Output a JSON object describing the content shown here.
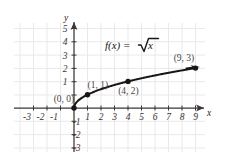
{
  "figure": {
    "axis_x_name": "x",
    "axis_y_name": "y",
    "function_label": "f(x) =",
    "function_radical": "x",
    "radical_symbol": "√",
    "point_labels": {
      "p0": "(0, 0)",
      "p1": "(1, 1)",
      "p4": "(4, 2)",
      "p9": "(9, 3)"
    },
    "x_ticks": [
      "-3",
      "-2",
      "-1",
      "1",
      "2",
      "3",
      "4",
      "5",
      "6",
      "7",
      "8",
      "9"
    ],
    "y_ticks": [
      "5",
      "4",
      "3",
      "2",
      "1",
      "-1",
      "-2",
      "-3"
    ],
    "colors": {
      "grid": "#e8e6e7",
      "axis": "#3b3638",
      "curve": "#1a1618",
      "text": "#231f20",
      "background": "#ffffff"
    }
  },
  "chart_data": {
    "type": "line",
    "xlabel": "x",
    "ylabel": "y",
    "xlim": [
      -4.5,
      10.5
    ],
    "ylim": [
      -3.8,
      6.0
    ],
    "grid": true,
    "legend": "none",
    "series": [
      {
        "name": "f(x) = √x",
        "x": [
          0,
          0.25,
          0.5,
          1,
          1.5,
          2,
          2.5,
          3,
          4,
          5,
          6,
          7,
          8,
          9
        ],
        "values": [
          0,
          0.5,
          0.707,
          1,
          1.225,
          1.414,
          1.581,
          1.732,
          2,
          2.236,
          2.449,
          2.646,
          2.828,
          3
        ]
      }
    ],
    "annotations": [
      {
        "label": "(0, 0)",
        "x": 0,
        "y": 0
      },
      {
        "label": "(1, 1)",
        "x": 1,
        "y": 1
      },
      {
        "label": "(4, 2)",
        "x": 4,
        "y": 2
      },
      {
        "label": "(9, 3)",
        "x": 9,
        "y": 3
      }
    ],
    "marked_points": [
      {
        "x": 0,
        "y": 0
      },
      {
        "x": 1,
        "y": 1
      },
      {
        "x": 4,
        "y": 2
      },
      {
        "x": 9,
        "y": 3
      }
    ],
    "xticks": [
      -3,
      -2,
      -1,
      1,
      2,
      3,
      4,
      5,
      6,
      7,
      8,
      9
    ],
    "yticks": [
      5,
      4,
      3,
      2,
      1,
      -1,
      -2,
      -3
    ]
  }
}
